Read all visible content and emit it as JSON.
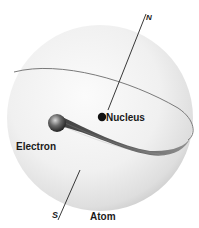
{
  "diagram": {
    "title": "Atom",
    "labels": {
      "nucleus": "Nucleus",
      "electron": "Electron",
      "atom": "Atom",
      "north_pole": "N",
      "south_pole": "S"
    },
    "colors": {
      "sphere_light": "#f7f7f7",
      "sphere_shadow": "#cfcfcf",
      "orbit": "#6e6e6e",
      "axis": "#222222",
      "nucleus": "#111111",
      "electron_trail": "#4a4a4a"
    }
  }
}
